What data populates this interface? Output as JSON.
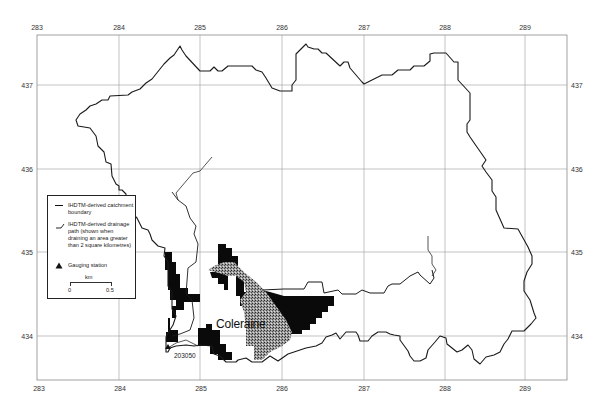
{
  "map": {
    "x_ticks": [
      "283",
      "284",
      "285",
      "286",
      "287",
      "288",
      "289"
    ],
    "y_ticks": [
      "437",
      "436",
      "435",
      "434"
    ],
    "town_label": "Coleraine",
    "station_label": "203050",
    "colors": {
      "boundary": "#1a1a1a",
      "grid": "#9a9a9a",
      "urban_dense": "#0a0a0a",
      "urban_stipple": "#6e6e6e",
      "background": "#ffffff"
    }
  },
  "legend": {
    "items": [
      {
        "icon": "boundary-line-icon",
        "label": "IHDTM-derived catchment boundary"
      },
      {
        "icon": "drainage-path-icon",
        "label": "IHDTM-derived drainage path (shown when draining an area greater than 2 square kilometres)"
      },
      {
        "icon": "triangle-icon",
        "label": "Gauging station"
      }
    ],
    "scale": {
      "unit": "km",
      "start": "0",
      "end": "0.5"
    }
  }
}
